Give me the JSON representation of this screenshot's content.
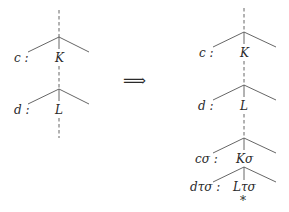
{
  "left_tree": {
    "nodes": [
      {
        "label": "K",
        "sublabel": "c :"
      },
      {
        "label": "L",
        "sublabel": "d :"
      }
    ]
  },
  "arrow": "⟹",
  "right_tree": {
    "nodes": [
      {
        "label": "K",
        "sublabel": "c :"
      },
      {
        "label": "L",
        "sublabel": "d :"
      },
      {
        "label": "Kσ",
        "sublabel": "cσ :"
      },
      {
        "label": "Lτσ",
        "sublabel": "dτσ :"
      }
    ],
    "marker": "*"
  }
}
